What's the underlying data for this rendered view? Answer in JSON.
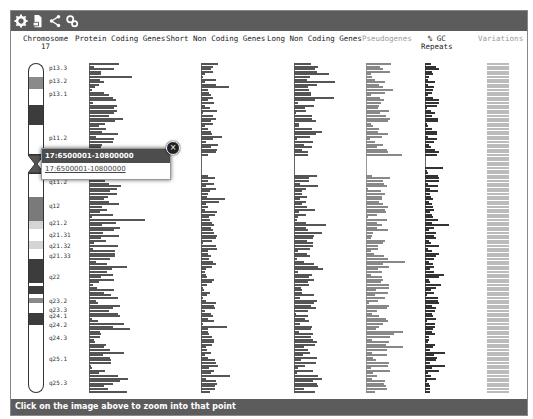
{
  "toolbar": {
    "icons": [
      "gear-icon",
      "export-icon",
      "share-icon",
      "config-icon"
    ]
  },
  "headers": {
    "chromosome": "Chromosome",
    "chromosome_number": "17",
    "protein_coding": "Protein Coding Genes",
    "short_non_coding": "Short Non Coding Genes",
    "long_non_coding": "Long Non Coding Genes",
    "pseudogenes": "Pseudogenes",
    "gc": "% GC",
    "repeats": "Repeats",
    "variations": "Variations"
  },
  "bands": [
    {
      "label": "p13.3",
      "top": 0,
      "height": 14,
      "color": "#ffffff"
    },
    {
      "label": "p13.2",
      "top": 14,
      "height": 12,
      "color": "#8a8a8a"
    },
    {
      "label": "p13.1",
      "top": 26,
      "height": 16,
      "color": "#ffffff"
    },
    {
      "label": "p12",
      "top": 42,
      "height": 20,
      "color": "#3c3c3c"
    },
    {
      "label": "p11.2",
      "top": 62,
      "height": 30,
      "color": "#ffffff"
    },
    {
      "label": "",
      "top": 92,
      "height": 18,
      "color": "centromere"
    },
    {
      "label": "q11.2",
      "top": 110,
      "height": 24,
      "color": "#ffffff"
    },
    {
      "label": "q12",
      "top": 134,
      "height": 24,
      "color": "#7a7a7a"
    },
    {
      "label": "q21.2",
      "top": 158,
      "height": 8,
      "color": "#d5d5d5"
    },
    {
      "label": "q21.31",
      "top": 166,
      "height": 12,
      "color": "#ffffff"
    },
    {
      "label": "q21.32",
      "top": 178,
      "height": 8,
      "color": "#d5d5d5"
    },
    {
      "label": "q21.33",
      "top": 186,
      "height": 10,
      "color": "#ffffff"
    },
    {
      "label": "q22",
      "top": 196,
      "height": 24,
      "color": "#3c3c3c"
    },
    {
      "label": "",
      "top": 220,
      "height": 3,
      "color": "#ffffff"
    },
    {
      "label": "q23.2",
      "top": 223,
      "height": 8,
      "color": "#3c3c3c"
    },
    {
      "label": "q23.3",
      "top": 231,
      "height": 4,
      "color": "#ffffff"
    },
    {
      "label": "q24.1",
      "top": 235,
      "height": 5,
      "color": "#8a8a8a"
    },
    {
      "label": "q24.2",
      "top": 240,
      "height": 10,
      "color": "#ffffff"
    },
    {
      "label": "q24.3",
      "top": 250,
      "height": 12,
      "color": "#3c3c3c"
    },
    {
      "label": "q25.1",
      "top": 262,
      "height": 16,
      "color": "#ffffff"
    },
    {
      "label": "q25.3",
      "top": 278,
      "height": 52,
      "color": "#ffffff"
    }
  ],
  "band_labels": [
    {
      "text": "p13.3",
      "y": 5
    },
    {
      "text": "p13.2",
      "y": 18
    },
    {
      "text": "p13.1",
      "y": 31
    },
    {
      "text": "p11.2",
      "y": 75
    },
    {
      "text": "q11.2",
      "y": 119
    },
    {
      "text": "q12",
      "y": 143
    },
    {
      "text": "q21.2",
      "y": 160
    },
    {
      "text": "q21.31",
      "y": 172
    },
    {
      "text": "q21.32",
      "y": 183
    },
    {
      "text": "q21.33",
      "y": 193
    },
    {
      "text": "q22",
      "y": 214
    },
    {
      "text": "q23.2",
      "y": 238
    },
    {
      "text": "q23.3",
      "y": 247
    },
    {
      "text": "q24.1",
      "y": 253
    },
    {
      "text": "q24.2",
      "y": 262
    },
    {
      "text": "q24.3",
      "y": 275
    },
    {
      "text": "q25.1",
      "y": 296
    },
    {
      "text": "q25.3",
      "y": 320
    }
  ],
  "popup": {
    "title": "17:6500001-10800000",
    "link": "17:6500001-10800000",
    "close": "×"
  },
  "footer": {
    "text": "Click on the image above to zoom into that point"
  }
}
